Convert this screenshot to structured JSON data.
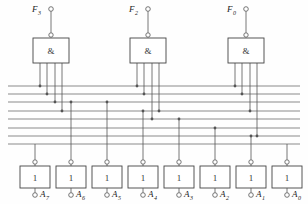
{
  "diagram": {
    "type": "logic-circuit",
    "canvas": {
      "width": 308,
      "height": 204
    },
    "colors": {
      "background": "#fefefe",
      "wire": "#555555",
      "bus": "#777777",
      "box_stroke": "#444444",
      "text": "#222222"
    },
    "and_gates": [
      {
        "id": "F3",
        "label": "F",
        "subscript": "3",
        "symbol": "&",
        "box": {
          "x": 33,
          "y": 38,
          "w": 36,
          "h": 25
        },
        "output_terminal": {
          "cx": 51,
          "cy": 9
        },
        "bubble": {
          "cx": 51,
          "cy": 35
        },
        "inputs": [
          {
            "x": 40,
            "drop_to_bus": 1
          },
          {
            "x": 47,
            "drop_to_bus": 2
          },
          {
            "x": 55,
            "drop_to_bus": 3
          },
          {
            "x": 62,
            "drop_to_bus": 4
          }
        ]
      },
      {
        "id": "F2",
        "label": "F",
        "subscript": "2",
        "symbol": "&",
        "box": {
          "x": 130,
          "y": 38,
          "w": 36,
          "h": 25
        },
        "output_terminal": {
          "cx": 148,
          "cy": 9
        },
        "bubble": {
          "cx": 148,
          "cy": 35
        },
        "inputs": [
          {
            "x": 137,
            "drop_to_bus": 1
          },
          {
            "x": 144,
            "drop_to_bus": 2
          },
          {
            "x": 152,
            "drop_to_bus": 5
          },
          {
            "x": 159,
            "drop_to_bus": 4
          }
        ]
      },
      {
        "id": "F0",
        "label": "F",
        "subscript": "0",
        "symbol": "&",
        "box": {
          "x": 228,
          "y": 38,
          "w": 36,
          "h": 25
        },
        "output_terminal": {
          "cx": 246,
          "cy": 9
        },
        "bubble": {
          "cx": 246,
          "cy": 35
        },
        "inputs": [
          {
            "x": 235,
            "drop_to_bus": 1
          },
          {
            "x": 242,
            "drop_to_bus": 2
          },
          {
            "x": 250,
            "drop_to_bus": 4
          },
          {
            "x": 257,
            "drop_to_bus": 7
          }
        ]
      }
    ],
    "bus_lines": [
      {
        "index": 1,
        "y": 86
      },
      {
        "index": 2,
        "y": 94
      },
      {
        "index": 3,
        "y": 102
      },
      {
        "index": 4,
        "y": 111
      },
      {
        "index": 5,
        "y": 119
      },
      {
        "index": 6,
        "y": 128
      },
      {
        "index": 7,
        "y": 136
      },
      {
        "index": 8,
        "y": 144
      }
    ],
    "bus_x_start": 8,
    "bus_x_end": 300,
    "inverters": [
      {
        "id": "A7",
        "label": "A",
        "subscript": "7",
        "symbol": "1",
        "box": {
          "x": 20,
          "y": 166,
          "w": 30,
          "h": 22
        },
        "x": 35,
        "top_terminal_y": 162,
        "bottom_terminal_y": 195,
        "bus": 8
      },
      {
        "id": "A6",
        "label": "A",
        "subscript": "6",
        "symbol": "1",
        "box": {
          "x": 56,
          "y": 166,
          "w": 30,
          "h": 22
        },
        "x": 71,
        "top_terminal_y": 162,
        "bottom_terminal_y": 195,
        "bus": 3
      },
      {
        "id": "A5",
        "label": "A",
        "subscript": "5",
        "symbol": "1",
        "box": {
          "x": 92,
          "y": 166,
          "w": 30,
          "h": 22
        },
        "x": 107,
        "top_terminal_y": 162,
        "bottom_terminal_y": 195,
        "bus": 3
      },
      {
        "id": "A4",
        "label": "A",
        "subscript": "4",
        "symbol": "1",
        "box": {
          "x": 128,
          "y": 166,
          "w": 30,
          "h": 22
        },
        "x": 143,
        "top_terminal_y": 162,
        "bottom_terminal_y": 195,
        "bus": 4
      },
      {
        "id": "A3",
        "label": "A",
        "subscript": "3",
        "symbol": "1",
        "box": {
          "x": 164,
          "y": 166,
          "w": 30,
          "h": 22
        },
        "x": 179,
        "top_terminal_y": 162,
        "bottom_terminal_y": 195,
        "bus": 5
      },
      {
        "id": "A2",
        "label": "A",
        "subscript": "2",
        "symbol": "1",
        "box": {
          "x": 200,
          "y": 166,
          "w": 30,
          "h": 22
        },
        "x": 215,
        "top_terminal_y": 162,
        "bottom_terminal_y": 195,
        "bus": 6
      },
      {
        "id": "A1",
        "label": "A",
        "subscript": "1",
        "symbol": "1",
        "box": {
          "x": 236,
          "y": 166,
          "w": 30,
          "h": 22
        },
        "x": 251,
        "top_terminal_y": 162,
        "bottom_terminal_y": 195,
        "bus": 7
      },
      {
        "id": "A0",
        "label": "A",
        "subscript": "0",
        "symbol": "1",
        "box": {
          "x": 272,
          "y": 166,
          "w": 30,
          "h": 22
        },
        "x": 287,
        "top_terminal_y": 162,
        "bottom_terminal_y": 195,
        "bus": 8
      }
    ],
    "junction_dots": [
      {
        "x": 40,
        "y": 86
      },
      {
        "x": 47,
        "y": 94
      },
      {
        "x": 55,
        "y": 102
      },
      {
        "x": 62,
        "y": 111
      },
      {
        "x": 137,
        "y": 86
      },
      {
        "x": 144,
        "y": 94
      },
      {
        "x": 159,
        "y": 111
      },
      {
        "x": 152,
        "y": 119
      },
      {
        "x": 235,
        "y": 86
      },
      {
        "x": 242,
        "y": 94
      },
      {
        "x": 250,
        "y": 111
      },
      {
        "x": 257,
        "y": 136
      },
      {
        "x": 71,
        "y": 102
      },
      {
        "x": 107,
        "y": 102
      },
      {
        "x": 143,
        "y": 111
      },
      {
        "x": 179,
        "y": 119
      },
      {
        "x": 215,
        "y": 128
      },
      {
        "x": 251,
        "y": 136
      }
    ]
  }
}
